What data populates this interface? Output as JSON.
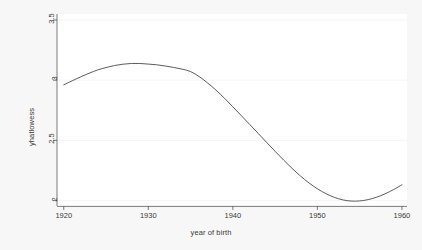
{
  "figure": {
    "background_color": "#f7f7f7",
    "plot_background_color": "#ffffff",
    "line_color": "#4a4a4a",
    "axis_color": "#5a5a5a",
    "grid_color": "#f0f0f0",
    "text_color": "#3a3a3a"
  },
  "chart_data": {
    "type": "line",
    "title": "",
    "xlabel": "year of birth",
    "ylabel": "yhatlowess",
    "xlim": [
      1919.2,
      1960.6
    ],
    "ylim": [
      1.955,
      3.55
    ],
    "xticks": [
      1920,
      1930,
      1940,
      1950,
      1960
    ],
    "xtick_labels": [
      "1920",
      "1930",
      "1940",
      "1950",
      "1960"
    ],
    "yticks": [
      2,
      2.5,
      3,
      3.5
    ],
    "ytick_labels": [
      "2",
      "2.5",
      "3",
      "3.5"
    ],
    "grid": "horizontal-faint",
    "legend": "none",
    "series": [
      {
        "name": "yhatlowess",
        "x": [
          1920,
          1921,
          1922,
          1923,
          1924,
          1925,
          1926,
          1927,
          1928,
          1929,
          1930,
          1931,
          1932,
          1933,
          1934,
          1935,
          1936,
          1937,
          1938,
          1939,
          1940,
          1941,
          1942,
          1943,
          1944,
          1945,
          1946,
          1947,
          1948,
          1949,
          1950,
          1951,
          1952,
          1953,
          1954,
          1955,
          1956,
          1957,
          1958,
          1959,
          1960
        ],
        "values": [
          2.962,
          2.995,
          3.028,
          3.058,
          3.085,
          3.105,
          3.122,
          3.133,
          3.139,
          3.139,
          3.134,
          3.128,
          3.118,
          3.106,
          3.092,
          3.072,
          3.031,
          2.978,
          2.918,
          2.851,
          2.779,
          2.706,
          2.632,
          2.558,
          2.483,
          2.409,
          2.337,
          2.268,
          2.204,
          2.147,
          2.098,
          2.058,
          2.027,
          2.006,
          1.996,
          1.997,
          2.008,
          2.028,
          2.056,
          2.091,
          2.131
        ]
      }
    ]
  },
  "axes": {
    "y_title": "yhatlowess",
    "x_title": "year of birth"
  }
}
